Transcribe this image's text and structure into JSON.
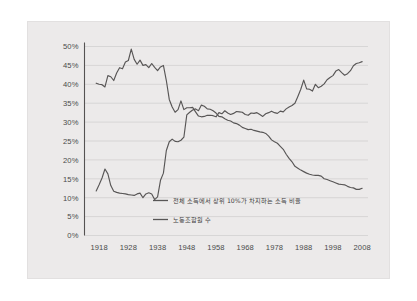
{
  "figure": {
    "panel_background": "#eceaea",
    "page_background": "#ffffff",
    "line_color": "#585656",
    "grid_color": "#c9c7c7",
    "axis_color": "#555252"
  },
  "chart_data": {
    "type": "line",
    "title": "",
    "subtitle": "",
    "xlabel": "",
    "ylabel": "",
    "xlim": [
      1913,
      2010
    ],
    "ylim": [
      0,
      50
    ],
    "grid": true,
    "legend_position": "inside-bottom-center",
    "y_ticks": [
      "0%",
      "5%",
      "10%",
      "15%",
      "20%",
      "25%",
      "30%",
      "35%",
      "40%",
      "45%",
      "50%"
    ],
    "y_tick_values": [
      0,
      5,
      10,
      15,
      20,
      25,
      30,
      35,
      40,
      45,
      50
    ],
    "x_ticks": [
      "1918",
      "1928",
      "1938",
      "1948",
      "1958",
      "1968",
      "1978",
      "1988",
      "1998",
      "2008"
    ],
    "x_tick_values": [
      1918,
      1928,
      1938,
      1948,
      1958,
      1968,
      1978,
      1988,
      1998,
      2008
    ],
    "series": [
      {
        "name": "전체 소득에서 상위 10%가 차지하는 소득 비율",
        "x": [
          1917,
          1918,
          1919,
          1920,
          1921,
          1922,
          1923,
          1924,
          1925,
          1926,
          1927,
          1928,
          1929,
          1930,
          1931,
          1932,
          1933,
          1934,
          1935,
          1936,
          1937,
          1938,
          1939,
          1940,
          1941,
          1942,
          1943,
          1944,
          1945,
          1946,
          1947,
          1948,
          1949,
          1950,
          1951,
          1952,
          1953,
          1954,
          1955,
          1956,
          1957,
          1958,
          1959,
          1960,
          1961,
          1962,
          1963,
          1964,
          1965,
          1966,
          1967,
          1968,
          1969,
          1970,
          1971,
          1972,
          1973,
          1974,
          1975,
          1976,
          1977,
          1978,
          1979,
          1980,
          1981,
          1982,
          1983,
          1984,
          1985,
          1986,
          1987,
          1988,
          1989,
          1990,
          1991,
          1992,
          1993,
          1994,
          1995,
          1996,
          1997,
          1998,
          1999,
          2000,
          2001,
          2002,
          2003,
          2004,
          2005,
          2006,
          2007,
          2008
        ],
        "values": [
          40.3,
          40.0,
          39.9,
          39.3,
          42.3,
          42.0,
          41.0,
          43.0,
          44.4,
          44.1,
          45.9,
          46.3,
          49.3,
          46.6,
          45.3,
          46.4,
          45.0,
          45.2,
          44.4,
          45.5,
          44.5,
          43.6,
          44.6,
          45.0,
          41.0,
          36.0,
          34.0,
          32.6,
          33.3,
          35.6,
          33.3,
          33.8,
          33.8,
          33.9,
          32.7,
          31.6,
          31.4,
          31.5,
          31.8,
          31.8,
          31.7,
          31.4,
          32.5,
          32.2,
          33.0,
          32.4,
          32.0,
          32.3,
          32.8,
          32.7,
          32.6,
          32.0,
          31.8,
          32.4,
          32.3,
          32.5,
          32.0,
          31.5,
          32.2,
          32.5,
          32.9,
          32.5,
          32.3,
          32.9,
          32.7,
          33.5,
          34.0,
          34.4,
          35.0,
          36.8,
          38.7,
          41.1,
          38.8,
          38.7,
          38.2,
          40.0,
          39.1,
          39.5,
          40.1,
          41.2,
          41.8,
          42.3,
          43.5,
          43.9,
          43.1,
          42.4,
          42.8,
          43.6,
          44.9,
          45.5,
          45.7,
          46.0
        ]
      },
      {
        "name": "노동조합원 수",
        "x": [
          1917,
          1918,
          1919,
          1920,
          1921,
          1922,
          1923,
          1924,
          1925,
          1926,
          1927,
          1928,
          1929,
          1930,
          1931,
          1932,
          1933,
          1934,
          1935,
          1936,
          1937,
          1938,
          1939,
          1940,
          1941,
          1942,
          1943,
          1944,
          1945,
          1946,
          1947,
          1948,
          1949,
          1950,
          1951,
          1952,
          1953,
          1954,
          1955,
          1956,
          1957,
          1958,
          1959,
          1960,
          1961,
          1962,
          1963,
          1964,
          1965,
          1966,
          1967,
          1968,
          1969,
          1970,
          1971,
          1972,
          1973,
          1974,
          1975,
          1976,
          1977,
          1978,
          1979,
          1980,
          1981,
          1982,
          1983,
          1984,
          1985,
          1986,
          1987,
          1988,
          1989,
          1990,
          1991,
          1992,
          1993,
          1994,
          1995,
          1996,
          1997,
          1998,
          1999,
          2000,
          2001,
          2002,
          2003,
          2004,
          2005,
          2006,
          2007,
          2008
        ],
        "values": [
          11.8,
          13.4,
          15.2,
          17.6,
          16.3,
          13.2,
          11.7,
          11.4,
          11.2,
          11.1,
          11.0,
          10.8,
          10.7,
          10.6,
          11.0,
          11.2,
          10.0,
          11.0,
          11.3,
          11.0,
          9.5,
          10.2,
          14.6,
          16.5,
          22.5,
          24.8,
          25.5,
          24.9,
          24.8,
          25.2,
          26.0,
          31.9,
          32.6,
          33.2,
          33.5,
          33.0,
          34.5,
          34.2,
          33.5,
          33.4,
          33.0,
          32.4,
          31.5,
          31.4,
          30.9,
          30.5,
          30.3,
          29.8,
          29.6,
          29.2,
          28.6,
          28.3,
          28.0,
          28.1,
          27.8,
          27.6,
          27.4,
          27.3,
          27.0,
          26.3,
          25.3,
          24.8,
          24.4,
          23.6,
          22.8,
          21.5,
          20.4,
          19.5,
          18.3,
          17.8,
          17.3,
          16.9,
          16.5,
          16.2,
          16.0,
          15.9,
          15.9,
          15.7,
          15.0,
          14.8,
          14.5,
          14.2,
          13.9,
          13.6,
          13.5,
          13.4,
          13.0,
          12.7,
          12.6,
          12.2,
          12.2,
          12.5
        ]
      }
    ],
    "legend": [
      {
        "label": "전체 소득에서 상위 10%가 차지하는 소득 비율"
      },
      {
        "label": "노동조합원 수"
      }
    ]
  }
}
